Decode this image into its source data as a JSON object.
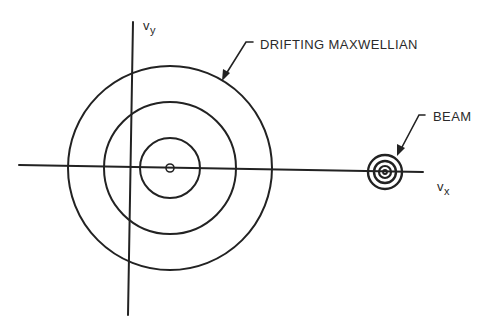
{
  "figure": {
    "type": "velocity-space-diagram",
    "axes": {
      "x_label_main": "v",
      "x_label_sub": "x",
      "y_label_main": "v",
      "y_label_sub": "y"
    },
    "annotations": {
      "maxwellian_label": "DRIFTING MAXWELLIAN",
      "beam_label": "BEAM"
    },
    "components": [
      {
        "name": "Drifting Maxwellian",
        "description": "Broad distribution centered at positive drift velocity",
        "contour_count": 4
      },
      {
        "name": "Beam",
        "description": "Narrow distribution centered at large v_x",
        "contour_count": 4
      }
    ],
    "colors": {
      "ink": "#222222",
      "background": "#ffffff"
    }
  }
}
